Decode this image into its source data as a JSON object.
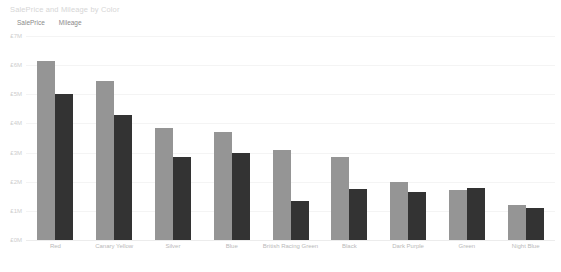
{
  "chart_title": "SalePrice and Mileage by Color",
  "legend": {
    "position": "top-left",
    "items": [
      {
        "label": "SalePrice",
        "color": "#959595",
        "icon": "circle-swatch-icon"
      },
      {
        "label": "Mileage",
        "color": "#333333",
        "icon": "circle-swatch-icon"
      }
    ]
  },
  "axis": {
    "y_ticks": [
      "£7M",
      "£6M",
      "£5M",
      "£4M",
      "£3M",
      "£2M",
      "£1M",
      "£0M"
    ],
    "y_tick_values": [
      7,
      6,
      5,
      4,
      3,
      2,
      1,
      0
    ]
  },
  "chart_data": {
    "type": "bar",
    "title": "SalePrice and Mileage by Color",
    "xlabel": "",
    "ylabel": "",
    "ylim": [
      0,
      7
    ],
    "grid": true,
    "legend_position": "top-left",
    "unit": "£ millions",
    "categories": [
      "Red",
      "Canary Yellow",
      "Silver",
      "Blue",
      "British Racing Green",
      "Black",
      "Dark Purple",
      "Green",
      "Night Blue"
    ],
    "series": [
      {
        "name": "SalePrice",
        "color": "#959595",
        "values": [
          6.15,
          5.45,
          3.85,
          3.7,
          3.1,
          2.85,
          2.0,
          1.7,
          1.2
        ]
      },
      {
        "name": "Mileage",
        "color": "#333333",
        "values": [
          5.0,
          4.3,
          2.85,
          3.0,
          1.35,
          1.75,
          1.65,
          1.8,
          1.1
        ]
      }
    ]
  }
}
